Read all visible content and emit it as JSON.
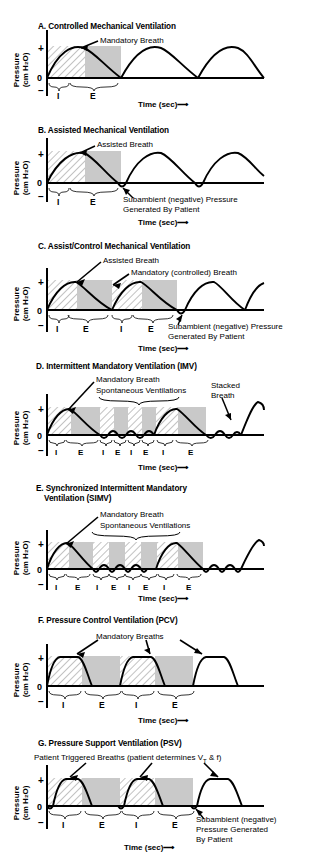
{
  "figure": {
    "axis": {
      "ylabel_line1": "Pressure",
      "ylabel_line2": "(cm H₂O)",
      "ytick_plus": "+",
      "ytick_zero": "0",
      "ytick_minus": "−",
      "xlabel": "Time (sec)",
      "xarrow": "⟶"
    },
    "phase_labels": {
      "inspiration": "I",
      "expiration": "E"
    },
    "panels": [
      {
        "id": "A",
        "title": "A. Controlled Mechanical Ventilation",
        "annotations": [
          "Mandatory Breath"
        ],
        "phase_sequence": [
          "I",
          "E"
        ]
      },
      {
        "id": "B",
        "title": "B. Assisted Mechanical Ventilation",
        "annotations": [
          "Assisted Breath",
          "Subambient (negative) Pressure",
          "Generated By Patient"
        ],
        "phase_sequence": [
          "I",
          "E"
        ]
      },
      {
        "id": "C",
        "title": "C. Assist/Control Mechanical Ventilation",
        "annotations": [
          "Assisted Breath",
          "Mandatory (controlled) Breath",
          "Subambient (negative) Pressure",
          "Generated By Patient"
        ],
        "phase_sequence": [
          "I",
          "E",
          "I",
          "E"
        ]
      },
      {
        "id": "D",
        "title": "D. Intermittent Mandatory Ventilation (IMV)",
        "annotations": [
          "Mandatory Breath",
          "Spontaneous Ventilations",
          "Stacked",
          "Breath"
        ],
        "phase_sequence": [
          "I",
          "E",
          "I",
          "E",
          "I",
          "E",
          "I",
          "E"
        ]
      },
      {
        "id": "E",
        "title_line1": "E. Synchronized Intermittent Mandatory",
        "title_line2": "Ventilation (SIMV)",
        "annotations": [
          "Mandatory Breath",
          "Spontaneous Ventilations"
        ],
        "phase_sequence": [
          "I",
          "E",
          "I",
          "E",
          "I",
          "E",
          "I",
          "E"
        ]
      },
      {
        "id": "F",
        "title": "F. Pressure Control Ventilation (PCV)",
        "annotations": [
          "Mandatory Breaths"
        ],
        "phase_sequence": [
          "I",
          "E",
          "I",
          "E"
        ]
      },
      {
        "id": "G",
        "title": "G. Pressure Support Ventilation (PSV)",
        "annotations": [
          "Patient Triggered Breaths (patient determines V",
          "T",
          " & f)",
          "Subambient (negative)",
          "Pressure Generated",
          "By Patient"
        ],
        "phase_sequence": [
          "I",
          "E",
          "I",
          "E"
        ]
      }
    ],
    "colors": {
      "curve": "#000000",
      "expiration_shade": "#c9c9c9",
      "inspiration_hatch": "#9a9a9a",
      "axis": "#000000"
    }
  }
}
